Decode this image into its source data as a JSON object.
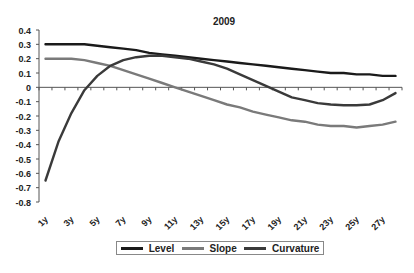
{
  "chart_data": {
    "type": "line",
    "title": "2009",
    "xlabel": "",
    "ylabel": "",
    "ylim": [
      -0.8,
      0.4
    ],
    "yticks": [
      "0.4",
      "0.3",
      "0.2",
      "0.1",
      "0",
      "-0.1",
      "-0.2",
      "-0.3",
      "-0.4",
      "-0.5",
      "-0.6",
      "-0.7",
      "-0.8"
    ],
    "x": [
      "1y",
      "2y",
      "3y",
      "4y",
      "5y",
      "6y",
      "7y",
      "8y",
      "9y",
      "10y",
      "11y",
      "12y",
      "13y",
      "14y",
      "15y",
      "16y",
      "17y",
      "18y",
      "19y",
      "20y",
      "21y",
      "22y",
      "23y",
      "24y",
      "25y",
      "26y",
      "27y",
      "28y"
    ],
    "xtick_labels": [
      "1y",
      "3y",
      "5y",
      "7y",
      "9y",
      "11y",
      "13y",
      "15y",
      "17y",
      "19y",
      "21y",
      "23y",
      "25y",
      "27y"
    ],
    "series": [
      {
        "name": "Level",
        "color": "#1a1a1a",
        "values": [
          0.3,
          0.3,
          0.3,
          0.3,
          0.29,
          0.28,
          0.27,
          0.26,
          0.24,
          0.23,
          0.22,
          0.21,
          0.2,
          0.19,
          0.18,
          0.17,
          0.16,
          0.15,
          0.14,
          0.13,
          0.12,
          0.11,
          0.1,
          0.1,
          0.09,
          0.09,
          0.08,
          0.08
        ]
      },
      {
        "name": "Slope",
        "color": "#7a7a7a",
        "values": [
          0.2,
          0.2,
          0.2,
          0.19,
          0.17,
          0.15,
          0.12,
          0.09,
          0.06,
          0.03,
          0.0,
          -0.03,
          -0.06,
          -0.09,
          -0.12,
          -0.14,
          -0.17,
          -0.19,
          -0.21,
          -0.23,
          -0.24,
          -0.26,
          -0.27,
          -0.27,
          -0.28,
          -0.27,
          -0.26,
          -0.24
        ]
      },
      {
        "name": "Curvature",
        "color": "#3a3a3a",
        "values": [
          -0.65,
          -0.38,
          -0.18,
          -0.02,
          0.08,
          0.15,
          0.19,
          0.21,
          0.22,
          0.22,
          0.21,
          0.2,
          0.18,
          0.16,
          0.13,
          0.09,
          0.05,
          0.01,
          -0.03,
          -0.07,
          -0.09,
          -0.11,
          -0.12,
          -0.125,
          -0.125,
          -0.12,
          -0.09,
          -0.04
        ]
      }
    ],
    "legend": {
      "position": "bottom",
      "entries": [
        "Level",
        "Slope",
        "Curvature"
      ]
    },
    "grid": false
  },
  "legend": {
    "items": [
      {
        "label": "Level",
        "color": "#1a1a1a"
      },
      {
        "label": "Slope",
        "color": "#7a7a7a"
      },
      {
        "label": "Curvature",
        "color": "#3a3a3a"
      }
    ]
  }
}
